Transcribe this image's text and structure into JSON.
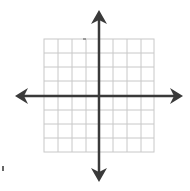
{
  "diagram": {
    "type": "coordinate-plane",
    "grid": {
      "columns": 8,
      "rows": 8,
      "cell_px": 14,
      "line_color": "#c8c8c8"
    },
    "axes": {
      "color": "#3a3a3a",
      "x_axis": "horizontal with arrows both ends",
      "y_axis": "vertical with arrows both ends"
    },
    "labels": []
  }
}
